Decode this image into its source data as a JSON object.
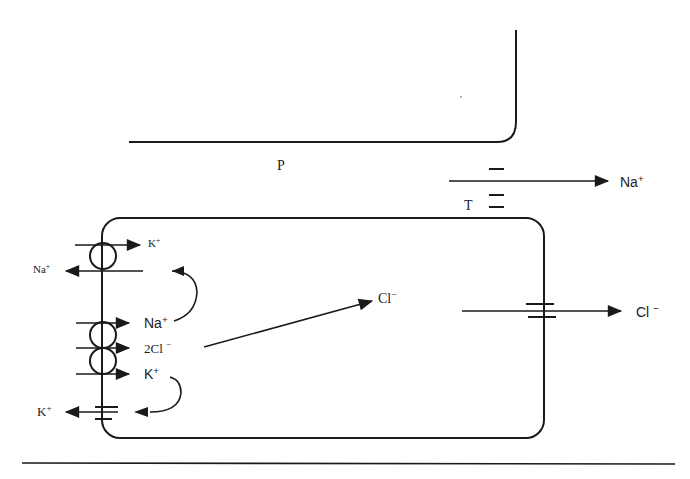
{
  "diagram": {
    "type": "epithelial-cell-ion-transport",
    "regions": {
      "peritubular_label": "P",
      "tight_junction_label": "T"
    },
    "ions": {
      "pump_out_na": {
        "symbol": "Na",
        "charge": "+"
      },
      "pump_in_k": {
        "symbol": "K",
        "charge": "+"
      },
      "cotransporter_na": {
        "symbol": "Na",
        "charge": "+"
      },
      "cotransporter_cl": {
        "symbol": "2Cl",
        "charge": "−"
      },
      "cotransporter_k": {
        "symbol": "K",
        "charge": "+"
      },
      "channel_k_out": {
        "symbol": "K",
        "charge": "+"
      },
      "intracellular_cl": {
        "symbol": "Cl",
        "charge": "−"
      },
      "apical_cl_out": {
        "symbol": "Cl",
        "charge": "−"
      },
      "paracellular_na": {
        "symbol": "Na",
        "charge": "+"
      }
    },
    "colors": {
      "line": "#1a1a1a",
      "background": "#ffffff"
    }
  }
}
